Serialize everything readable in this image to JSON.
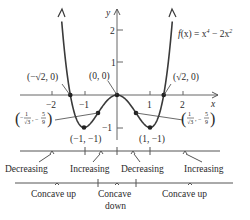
{
  "equation_label": {
    "f": "f",
    "x_paren": "(x) = x",
    "exp4": "4",
    "mid": " − 2x",
    "exp2": "2"
  },
  "axes": {
    "x_label": "x",
    "y_label": "y",
    "x_ticks": [
      "−2",
      "−1",
      "1",
      "2"
    ],
    "y_ticks": [
      "2",
      "1",
      "−1"
    ]
  },
  "points": {
    "neg_root": "(−√2, 0)",
    "origin": "(0, 0)",
    "pos_root": "(√2, 0)",
    "neg_min": "(−1, −1)",
    "pos_min": "(1, −1)",
    "neg_inflection": {
      "num": "1",
      "den": "√3",
      "yval_num": "5",
      "yval_den": "9"
    },
    "pos_inflection": {
      "num": "1",
      "den": "√3",
      "yval_num": "5",
      "yval_den": "9"
    }
  },
  "monotonicity": {
    "intervals": [
      "Decreasing",
      "Increasing",
      "Decreasing",
      "Increasing"
    ]
  },
  "concavity": {
    "intervals": [
      "Concave up",
      "Concave",
      "down",
      "Concave up"
    ]
  },
  "colors": {
    "curve": "#3a3a3a",
    "axis": "#555555",
    "text": "#2a2a2a"
  }
}
